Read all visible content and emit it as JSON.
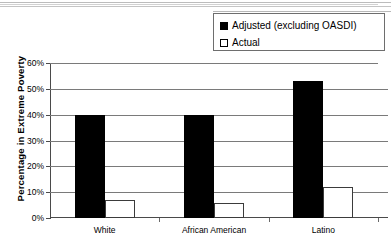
{
  "chart_data": {
    "type": "bar",
    "title": "",
    "xlabel": "",
    "ylabel": "Percentage in Extreme Poverty",
    "categories": [
      "White",
      "African American",
      "Latino"
    ],
    "series": [
      {
        "name": "Adjusted (excluding OASDI)",
        "color": "#000000",
        "values": [
          40,
          40,
          53
        ]
      },
      {
        "name": "Actual",
        "color": "#ffffff",
        "values": [
          7,
          6,
          12
        ]
      }
    ],
    "ylim": [
      0,
      60
    ],
    "ytick_step": 10,
    "ytick_labels": [
      "0%",
      "10%",
      "20%",
      "30%",
      "40%",
      "50%",
      "60%"
    ],
    "ytick_values": [
      0,
      10,
      20,
      30,
      40,
      50,
      60
    ],
    "grid": true,
    "legend_position": "top-right",
    "value_format": "percent"
  },
  "legend": {
    "entries": [
      {
        "label": "Adjusted (excluding OASDI)",
        "marker": "filled-square-black"
      },
      {
        "label": "Actual",
        "marker": "outlined-square-white"
      }
    ]
  },
  "axes": {
    "y_axis_title": "Percentage in Extreme Poverty"
  }
}
